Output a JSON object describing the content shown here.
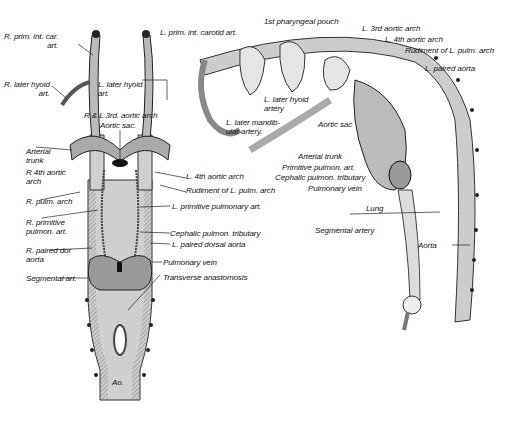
{
  "figure": {
    "left_view": {
      "labels": [
        {
          "id": "r_prim_int_car",
          "text": "R. prim. int. car.\nart."
        },
        {
          "id": "r_later_hyoid",
          "text": "R. later hyoid\nart."
        },
        {
          "id": "l_later_hyoid",
          "text": "L. later hyoid\nart."
        },
        {
          "id": "rl_3rd_arch",
          "text": "R & L 3rd. aortic arch"
        },
        {
          "id": "aortic_sac",
          "text": "Aortic sac."
        },
        {
          "id": "arterial_trunk",
          "text": "Arterial\ntrunk"
        },
        {
          "id": "r_4th_arch",
          "text": "R 4th aortic\narch"
        },
        {
          "id": "r_pulm_arch",
          "text": "R. pulm. arch"
        },
        {
          "id": "r_prim_pulm",
          "text": "R. primitive\npulmon. art."
        },
        {
          "id": "r_paired_dor",
          "text": "R. paired dor\naorta"
        },
        {
          "id": "segmental_art",
          "text": "Segmental art."
        },
        {
          "id": "l_4th_arch",
          "text": "L. 4th aortic arch"
        },
        {
          "id": "rudiment_l_pulm",
          "text": "Rudiment of L. pulm. arch"
        },
        {
          "id": "l_prim_pulm",
          "text": "L. primitive pulmonary art."
        },
        {
          "id": "cephalic_pulm",
          "text": "Cephalic pulmon. tributary"
        },
        {
          "id": "l_paired_dorsal",
          "text": "L. paired dorsal aorta"
        },
        {
          "id": "pulmonary_vein",
          "text": "Pulmonary vein"
        },
        {
          "id": "transverse",
          "text": "Transverse anastomosis"
        },
        {
          "id": "ao",
          "text": "Ao."
        }
      ]
    },
    "right_view": {
      "labels": [
        {
          "id": "l_prim_int_carotid",
          "text": "L. prim. int. carotid art."
        },
        {
          "id": "pharyngeal_pouch",
          "text": "1st pharyngeal pouch"
        },
        {
          "id": "l_3rd_arch",
          "text": "L. 3rd aortic arch"
        },
        {
          "id": "l_4th_arch",
          "text": "L. 4th aortic arch"
        },
        {
          "id": "rudiment",
          "text": "Rudiment of L. pulm. arch"
        },
        {
          "id": "l_paired_aorta",
          "text": "L. paired aorta"
        },
        {
          "id": "l_later_hyoid",
          "text": "L. later hyoid\nartery"
        },
        {
          "id": "l_later_mandib",
          "text": "L. later mandib-\nular artery."
        },
        {
          "id": "aortic_sac",
          "text": "Aortic sac"
        },
        {
          "id": "arterial_trunk",
          "text": "Arterial trunk"
        },
        {
          "id": "prim_pulm",
          "text": "Primitive pulmon. art."
        },
        {
          "id": "cephalic_pulm",
          "text": "Cephalic pulmon. tributary"
        },
        {
          "id": "pulm_vein",
          "text": "Pulmonary vein"
        },
        {
          "id": "lung",
          "text": "Lung"
        },
        {
          "id": "segmental_artery",
          "text": "Segmental artery"
        },
        {
          "id": "aorta",
          "text": "Aorta"
        }
      ]
    }
  }
}
